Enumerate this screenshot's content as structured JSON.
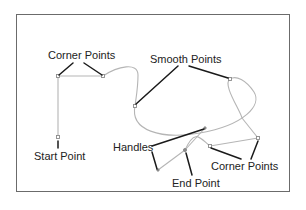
{
  "diagram": {
    "labels": {
      "corner_points_top": "Corner Points",
      "smooth_points": "Smooth Points",
      "start_point": "Start Point",
      "handles": "Handles",
      "end_point": "End Point",
      "corner_points_bottom": "Corner Points"
    },
    "colors": {
      "frame": "#6b6b6b",
      "path": "#b5b5b5",
      "leader": "#1a1a1a",
      "text": "#222222",
      "background": "#ffffff"
    }
  }
}
